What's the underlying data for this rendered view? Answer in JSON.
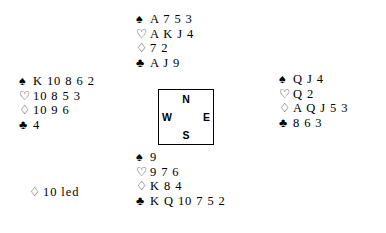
{
  "diagram": {
    "type": "bridge-hand-deal",
    "suit_glyphs": {
      "spade": "♠",
      "heart": "♡",
      "diamond": "♢",
      "club": "♣"
    },
    "compass": {
      "north": "N",
      "south": "S",
      "east": "E",
      "west": "W"
    },
    "hands": {
      "north": {
        "spades": "A 7 5 3",
        "hearts": "A K J 4",
        "diamonds": "7 2",
        "clubs": "A J 9"
      },
      "west": {
        "spades": "K 10 8 6 2",
        "hearts": "10 8 5 3",
        "diamonds": "10 9 6",
        "clubs": "4"
      },
      "east": {
        "spades": "Q J 4",
        "hearts": "Q 2",
        "diamonds": "A Q J 5 3",
        "clubs": "8 6 3"
      },
      "south": {
        "spades": "9",
        "hearts": "9 7 6",
        "diamonds": "K 8 4",
        "clubs": "K Q 10 7 5 2"
      }
    },
    "lead": {
      "suit": "♢",
      "text": "10 led"
    }
  }
}
